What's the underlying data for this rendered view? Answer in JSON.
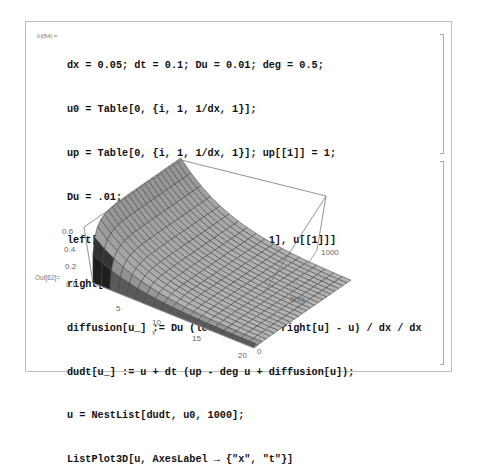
{
  "notebook": {
    "input_cell": {
      "label": "In[54]:=",
      "lines": [
        "dx = 0.05; dt = 0.1; Du = 0.01; deg = 0.5;",
        "u0 = Table[0, {i, 1, 1/dx, 1}];",
        "up = Table[0, {i, 1, 1/dx, 1}]; up[[1]] = 1;",
        "Du = .01;",
        "left[u_List] := Prepend[Drop[u, -1], u[[1]]]",
        "right[u_List] := Append[Drop[u, 1], u[[-1]]]",
        "diffusion[u_] := Du (left[u] - u + right[u] - u) / dx / dx",
        "dudt[u_] := u + dt (up - deg u + diffusion[u]);",
        "u = NestList[dudt, u0, 1000];",
        "ListPlot3D[u, AxesLabel → {\"x\", \"t\"}]"
      ]
    },
    "output_cell": {
      "label": "Out[62]=",
      "plot": {
        "type": "surface3d",
        "z_ticks": [
          "0.0",
          "0.2",
          "0.4",
          "0.6"
        ],
        "x_ticks": [
          "5",
          "10",
          "15",
          "20"
        ],
        "t_ticks": [
          "0",
          "500",
          "1000"
        ],
        "x_label": "x",
        "t_label": "t"
      }
    }
  },
  "chart_data": {
    "type": "surface3d",
    "title": "",
    "xlabel": "x",
    "ylabel": "t",
    "zlabel": "",
    "x_range": [
      1,
      20
    ],
    "t_range": [
      0,
      1000
    ],
    "z_range": [
      0,
      0.6
    ],
    "x_ticks": [
      5,
      10,
      15,
      20
    ],
    "t_ticks": [
      0,
      500,
      1000
    ],
    "z_ticks": [
      0.0,
      0.2,
      0.4,
      0.6
    ]
  }
}
